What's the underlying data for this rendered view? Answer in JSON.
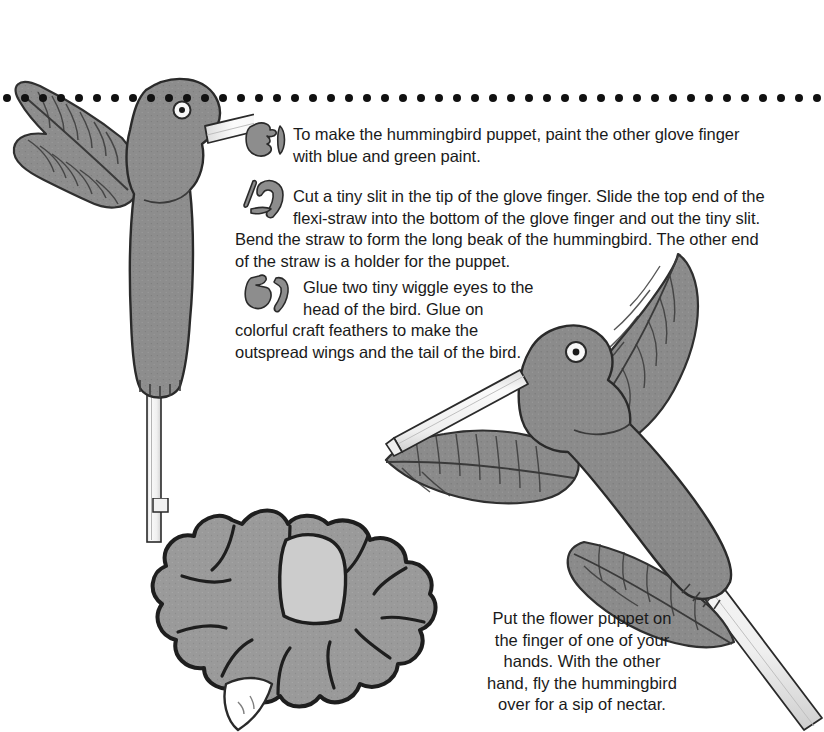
{
  "page": {
    "background_color": "#ffffff",
    "ink_color": "#1a1a1a",
    "art_fill_gray": "#8d8d8d",
    "art_fill_light": "#c9c9c9",
    "straw_color": "#f4f4f4",
    "dotted_rule": {
      "dot_color": "#111111",
      "dot_diameter_px": 8,
      "dot_spacing_px": 18,
      "y_px": 98
    }
  },
  "steps": [
    {
      "number": "3",
      "number_icon": "paint-splotch-numeral-3-icon",
      "text": "To make the hummingbird puppet, paint the other glove finger with blue and green paint.",
      "lines": [
        "To make the hummingbird puppet, paint the other glove finger",
        "with blue and green paint."
      ]
    },
    {
      "number": "4",
      "number_icon": "paint-splotch-numeral-4-icon",
      "text": "Cut a tiny slit in the tip of the glove finger. Slide the top end of the flexi-straw into the bottom of the glove finger and out the tiny slit. Bend the straw to form the long beak of the hummingbird. The other end of the straw is a holder for the puppet.",
      "indented_lines": [
        "Cut a tiny slit in the tip of the glove finger. Slide the top end of the",
        "flexi-straw into the bottom of the glove finger and out the tiny slit."
      ],
      "full_width_lines": [
        "Bend the straw to form the long beak of the hummingbird. The other end",
        "of the straw is a holder for the puppet."
      ]
    },
    {
      "number": "5",
      "number_icon": "paint-splotch-numeral-5-icon",
      "text": "Glue two tiny wiggle eyes to the head of the bird. Glue on colorful craft feathers to make the outspread wings and the tail of the bird.",
      "indented_lines": [
        "Glue two tiny wiggle eyes to",
        "the head of the bird. Glue on"
      ],
      "full_width_lines": [
        "colorful craft feathers to make the",
        "outspread wings and the tail of",
        "the bird."
      ]
    }
  ],
  "caption": {
    "text": "Put the flower puppet on the finger of one of your hands. With the other hand, fly the hummingbird over for a sip of nectar.",
    "lines": [
      "Put the flower puppet on",
      "the finger of one of your",
      "hands. With the other",
      "hand, fly the hummingbird",
      "over for a sip of nectar."
    ]
  },
  "illustrations": [
    {
      "name": "hummingbird-puppet-top-left",
      "description": "Gray hummingbird glove-finger puppet facing right with a long white flexi-straw beak, a large craft feather wing, mounted on a vertical white straw holder."
    },
    {
      "name": "hummingbird-puppet-right",
      "description": "Gray hummingbird puppet angled down-right with outspread craft feather wings, tail feathers, a white flexi-straw beak and a long diagonal straw holder."
    },
    {
      "name": "flower-puppet",
      "description": "Gray splotch-shaped craft-foam flower with a light center petal and a finger opening at the bottom."
    }
  ]
}
